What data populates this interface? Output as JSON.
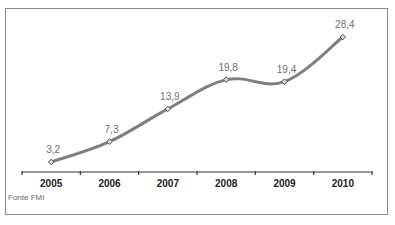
{
  "chart_data": {
    "type": "line",
    "title": "",
    "xlabel": "",
    "ylabel": "",
    "categories": [
      "2005",
      "2006",
      "2007",
      "2008",
      "2009",
      "2010"
    ],
    "series": [
      {
        "name": "",
        "values": [
          3.2,
          7.3,
          13.9,
          19.8,
          19.4,
          28.4
        ]
      }
    ],
    "data_labels": [
      "3,2",
      "7,3",
      "13,9",
      "19,8",
      "19,4",
      "28,4"
    ],
    "ylim": [
      0,
      30
    ],
    "grid": false,
    "legend": "none",
    "line_smooth": true,
    "colors": {
      "line": "#7f7f7f",
      "marker": "#555555",
      "label": "#6e6e6e",
      "axis": "#333333",
      "frame": "#8a8a8a"
    }
  },
  "source": "Fonte FMI"
}
